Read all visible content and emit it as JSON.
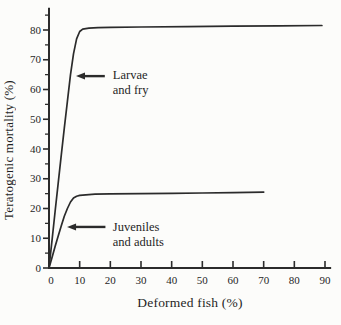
{
  "figure": {
    "background": "#fcfcfa",
    "line_color": "#2b2b2b",
    "text_color": "#1f1f1f"
  },
  "chart_data": {
    "type": "line",
    "title": "",
    "xlabel": "Deformed fish (%)",
    "ylabel": "Teratogenic mortality (%)",
    "xlim": [
      0,
      92
    ],
    "ylim": [
      0,
      87.5
    ],
    "x_ticks": [
      0,
      10,
      20,
      30,
      40,
      50,
      60,
      70,
      80,
      90
    ],
    "y_ticks": [
      0,
      10,
      20,
      30,
      40,
      50,
      60,
      70,
      80
    ],
    "y_minor_tick_step": 5,
    "y_minor_tick_max": 85,
    "grid": false,
    "legend_position": "none",
    "series": [
      {
        "name": "Larvae and fry",
        "points": [
          [
            0,
            0
          ],
          [
            1,
            9.5
          ],
          [
            2,
            19
          ],
          [
            3,
            28.5
          ],
          [
            4,
            38
          ],
          [
            5,
            47
          ],
          [
            6,
            56
          ],
          [
            7,
            65
          ],
          [
            8,
            72
          ],
          [
            9,
            77
          ],
          [
            10,
            79.5
          ],
          [
            11,
            80.3
          ],
          [
            13,
            80.6
          ],
          [
            16,
            80.8
          ],
          [
            20,
            80.9
          ],
          [
            30,
            81.0
          ],
          [
            45,
            81.1
          ],
          [
            60,
            81.3
          ],
          [
            75,
            81.4
          ],
          [
            89,
            81.5
          ]
        ]
      },
      {
        "name": "Juveniles and adults",
        "points": [
          [
            0,
            0
          ],
          [
            1,
            3.6
          ],
          [
            2,
            7.2
          ],
          [
            3,
            10.8
          ],
          [
            4,
            14.2
          ],
          [
            5,
            17.4
          ],
          [
            6,
            20
          ],
          [
            7,
            22.2
          ],
          [
            8,
            23.5
          ],
          [
            9,
            24.1
          ],
          [
            10,
            24.4
          ],
          [
            12,
            24.6
          ],
          [
            15,
            24.8
          ],
          [
            20,
            24.9
          ],
          [
            30,
            25.0
          ],
          [
            40,
            25.1
          ],
          [
            50,
            25.2
          ],
          [
            60,
            25.3
          ],
          [
            70,
            25.5
          ]
        ]
      }
    ],
    "annotations": [
      {
        "lines": [
          "Larvae",
          "and fry"
        ],
        "arrow_tip_x": 8.8,
        "arrow_tip_y": 64.5,
        "arrow_tail_x": 18.2,
        "text_x": 20.8,
        "text_y": 63.6
      },
      {
        "lines": [
          "Juveniles",
          "and adults"
        ],
        "arrow_tip_x": 5.9,
        "arrow_tip_y": 13.8,
        "arrow_tail_x": 18.4,
        "text_x": 20.8,
        "text_y": 12.4
      }
    ]
  }
}
